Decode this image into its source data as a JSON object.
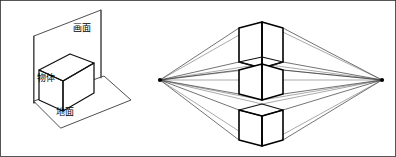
{
  "figure": {
    "width": 396,
    "height": 157,
    "background_color": "#ffffff",
    "border_color": "#2b2b2b",
    "line_color": "#111111",
    "ray_color": "#1c1c1c"
  },
  "left_diagram": {
    "name": "picture-plane-setup",
    "labels": {
      "picture_plane": "画面",
      "object": "物体",
      "ground_plane": "地面"
    },
    "label_positions": {
      "picture_plane": {
        "x": 73,
        "y": 24
      },
      "object": {
        "x": 37,
        "y": 74
      },
      "ground_plane": {
        "x": 56,
        "y": 108
      }
    },
    "ground_plane_polygon": "34,101 104,76 131,100 61,128",
    "picture_plane_polygon": "34,36 101,10 101,78 34,103",
    "cube": {
      "top_face": "39,70 70,54 94,63 63,81",
      "left_face": "39,70 63,81 63,111 39,100",
      "right_face": "63,81 94,63 94,93 63,111"
    }
  },
  "right_diagram": {
    "name": "two-point-perspective-cubes",
    "vanishing_points": {
      "left": {
        "x": 160,
        "y": 80,
        "label": "left-vanishing-point"
      },
      "right": {
        "x": 382,
        "y": 80,
        "label": "right-vanishing-point"
      }
    },
    "horizon_y": 80,
    "cubes": [
      {
        "name": "cube-above-eye-level",
        "view": "from-below",
        "front_vertical_x": 262,
        "back_vertical_x": 239,
        "right_vertical_x": 283,
        "top_apex_y": 22,
        "bottom_y": 62
      },
      {
        "name": "cube-at-eye-level",
        "view": "eye-level",
        "front_vertical_x": 262,
        "back_vertical_x": 239,
        "right_vertical_x": 283,
        "top_y": 64,
        "bottom_y": 100
      },
      {
        "name": "cube-below-eye-level",
        "view": "from-above",
        "front_vertical_x": 262,
        "back_vertical_x": 239,
        "right_vertical_x": 283,
        "top_y": 104,
        "bottom_apex_y": 146
      }
    ]
  }
}
